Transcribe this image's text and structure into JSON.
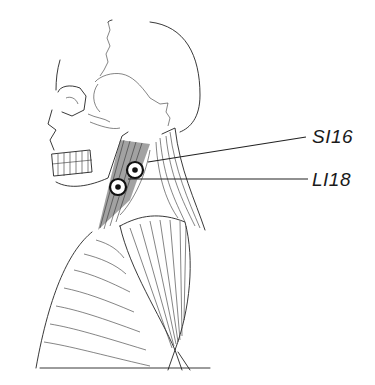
{
  "figure": {
    "colors": {
      "ink": "#222222",
      "background": "#ffffff",
      "marker": "#111111"
    }
  },
  "points": [
    {
      "id": "SI16",
      "label": "SI16",
      "marker": {
        "x": 135,
        "y": 170
      },
      "leader": {
        "x1": 148,
        "y1": 162,
        "x2": 306,
        "y2": 137
      },
      "label_pos": {
        "x": 312,
        "y": 126
      }
    },
    {
      "id": "LI18",
      "label": "LI18",
      "marker": {
        "x": 118,
        "y": 187
      },
      "leader": {
        "x1": 128,
        "y1": 179,
        "x2": 308,
        "y2": 179
      },
      "label_pos": {
        "x": 312,
        "y": 169
      }
    }
  ]
}
